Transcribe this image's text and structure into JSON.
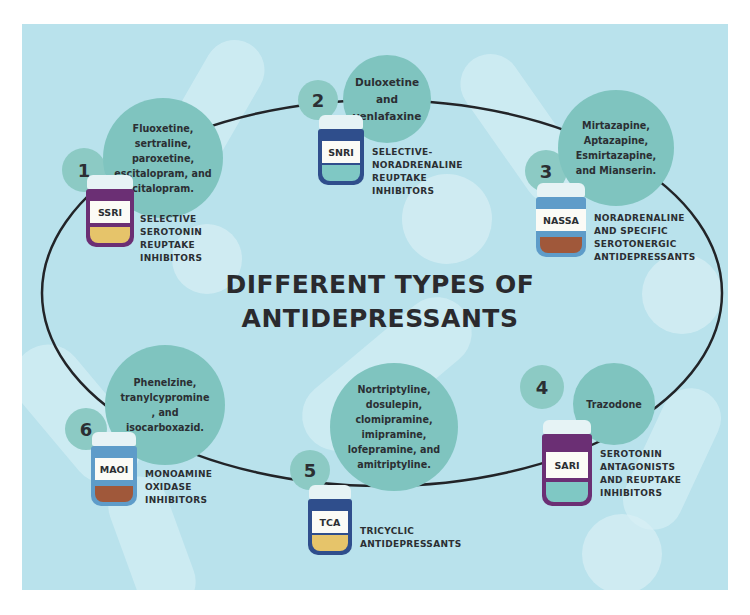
{
  "title": {
    "line1": "DIFFERENT TYPES OF",
    "line2": "ANTIDEPRESSANTS"
  },
  "colors": {
    "background": "#b9e2ec",
    "bubble": "#7fc4bf",
    "ring": "#222428"
  },
  "types": [
    {
      "number": "1",
      "abbr": "SSRI",
      "full": [
        "SELECTIVE",
        "SEROTONIN",
        "REUPTAKE",
        "INHIBITORS"
      ],
      "drugs": [
        "Fluoxetine,",
        "sertraline,",
        "paroxetine,",
        "escitalopram, and",
        "citalopram."
      ],
      "bottle_color": "#6b2f74"
    },
    {
      "number": "2",
      "abbr": "SNRI",
      "full": [
        "SELECTIVE-",
        "NORADRENALINE",
        "REUPTAKE",
        "INHIBITORS"
      ],
      "drugs": [
        "Duloxetine",
        "and",
        "venlafaxine"
      ],
      "bottle_color": "#2f4e8c"
    },
    {
      "number": "3",
      "abbr": "NASSA",
      "full": [
        "NORADRENALINE",
        "AND SPECIFIC",
        "SEROTONERGIC",
        "ANTIDEPRESSANTS"
      ],
      "drugs": [
        "Mirtazapine,",
        "Aptazapine,",
        "Esmirtazapine,",
        "and Mianserin."
      ],
      "bottle_color": "#5e9cc9"
    },
    {
      "number": "4",
      "abbr": "SARI",
      "full": [
        "SEROTONIN",
        "ANTAGONISTS",
        "AND REUPTAKE",
        "INHIBITORS"
      ],
      "drugs": [
        "Trazodone"
      ],
      "bottle_color": "#6b2f74"
    },
    {
      "number": "5",
      "abbr": "TCA",
      "full": [
        "TRICYCLIC",
        "ANTIDEPRESSANTS"
      ],
      "drugs": [
        "Nortriptyline,",
        "dosulepin,",
        "clomipramine,",
        "imipramine,",
        "lofepramine, and",
        "amitriptyline."
      ],
      "bottle_color": "#2f4e8c"
    },
    {
      "number": "6",
      "abbr": "MAOI",
      "full": [
        "MONOAMINE",
        "OXIDASE",
        "INHIBITORS"
      ],
      "drugs": [
        "Phenelzine,",
        "tranylcypromine",
        ", and",
        "isocarboxazid."
      ],
      "bottle_color": "#5e9cc9"
    }
  ]
}
